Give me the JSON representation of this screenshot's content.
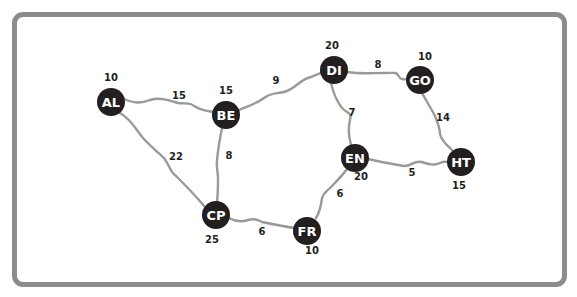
{
  "colors": {
    "node": "#231f20",
    "edge": "#9a9a9a",
    "frame": "#8c8c8c",
    "label": "#ffffff"
  },
  "nodes": [
    {
      "id": "AL",
      "value": "10",
      "x": 111,
      "y": 102,
      "vx": 111,
      "vy": 77
    },
    {
      "id": "BE",
      "value": "15",
      "x": 226,
      "y": 115,
      "vx": 226,
      "vy": 90
    },
    {
      "id": "DI",
      "value": "20",
      "x": 334,
      "y": 70,
      "vx": 332,
      "vy": 45
    },
    {
      "id": "GO",
      "value": "10",
      "x": 420,
      "y": 80,
      "vx": 425,
      "vy": 56
    },
    {
      "id": "EN",
      "value": "20",
      "x": 355,
      "y": 158,
      "vx": 361,
      "vy": 176
    },
    {
      "id": "HT",
      "value": "15",
      "x": 461,
      "y": 162,
      "vx": 459,
      "vy": 185
    },
    {
      "id": "CP",
      "value": "25",
      "x": 216,
      "y": 215,
      "vx": 212,
      "vy": 239
    },
    {
      "id": "FR",
      "value": "10",
      "x": 307,
      "y": 231,
      "vx": 312,
      "vy": 250
    }
  ],
  "edges": [
    {
      "from": "AL",
      "to": "BE",
      "weight": "15",
      "d": "M124,99 C134,103 140,104 150,100 C160,97 168,100 178,103 C186,104 190,102 194,106 C200,110 206,111 213,112",
      "lx": 179,
      "ly": 95
    },
    {
      "from": "AL",
      "to": "CP",
      "weight": "22",
      "d": "M120,113 C132,120 136,130 143,138 C150,146 158,152 164,158 C170,166 170,172 176,176 C186,186 196,196 204,206",
      "lx": 176,
      "ly": 156
    },
    {
      "from": "BE",
      "to": "DI",
      "weight": "9",
      "d": "M239,110 C248,106 256,104 264,98 C272,92 276,94 284,92 C294,90 300,80 308,78 C314,76 318,74 321,73",
      "lx": 276,
      "ly": 80
    },
    {
      "from": "BE",
      "to": "CP",
      "weight": "8",
      "d": "M222,128 C220,138 218,150 217,160 C216,168 218,172 218,178 C218,186 218,194 217,202",
      "lx": 229,
      "ly": 155
    },
    {
      "from": "DI",
      "to": "GO",
      "weight": "8",
      "d": "M347,72 C360,74 372,73 384,73 C394,73 396,72 398,75 C400,79 402,80 407,79",
      "lx": 378,
      "ly": 64
    },
    {
      "from": "DI",
      "to": "EN",
      "weight": "7",
      "d": "M331,83 C334,94 336,100 342,108 C348,114 352,112 350,120 C348,128 348,134 351,145",
      "lx": 352,
      "ly": 112
    },
    {
      "from": "GO",
      "to": "HT",
      "weight": "14",
      "d": "M422,93 C428,104 432,110 435,116 C438,124 440,128 440,134 C442,142 448,146 452,150",
      "lx": 443,
      "ly": 117
    },
    {
      "from": "EN",
      "to": "HT",
      "weight": "5",
      "d": "M368,159 C380,162 392,164 404,166 C412,166 414,160 422,162 C428,164 434,166 440,163 C444,161 446,162 448,162",
      "lx": 412,
      "ly": 172
    },
    {
      "from": "EN",
      "to": "FR",
      "weight": "6",
      "d": "M347,169 C342,176 336,182 330,188 C326,192 324,192 322,198 C321,206 320,212 316,218",
      "lx": 340,
      "ly": 193
    },
    {
      "from": "CP",
      "to": "FR",
      "weight": "6",
      "d": "M229,218 C236,222 242,222 248,220 C254,218 258,220 262,222 C272,224 282,226 294,228",
      "lx": 262,
      "ly": 231
    }
  ]
}
